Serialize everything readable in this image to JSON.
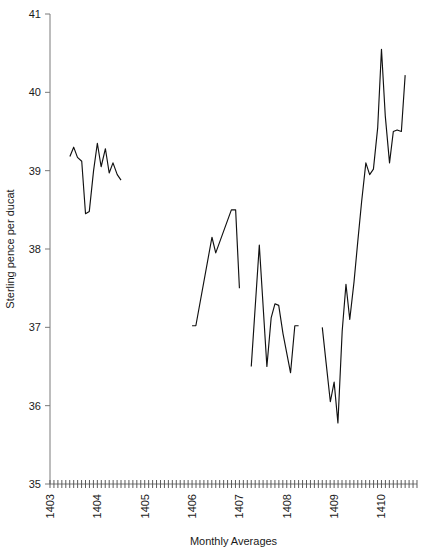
{
  "chart_data": {
    "type": "line",
    "title": "",
    "xlabel": "Monthly Averages",
    "ylabel": "Sterling pence per ducat",
    "ylim": [
      35,
      41
    ],
    "y_ticks": [
      35,
      36,
      37,
      38,
      39,
      40,
      41
    ],
    "y_tick_labels": [
      "35",
      "36",
      "37",
      "38",
      "39",
      "40",
      "41"
    ],
    "xlim": [
      1403.0,
      1410.75
    ],
    "x_year_ticks": [
      1403,
      1404,
      1405,
      1406,
      1407,
      1408,
      1409,
      1410
    ],
    "x_year_labels": [
      "1403",
      "1404",
      "1405",
      "1406",
      "1407",
      "1408",
      "1409",
      "1410"
    ],
    "x_minor_tick_interval_years": 0.08333,
    "grid": false,
    "legend": null,
    "series": [
      {
        "name": "Sterling pence per ducat",
        "note": "single series plotted in four separate runs separated by gaps of missing months",
        "segments": [
          {
            "name": "segment-1403-1404",
            "points": [
              {
                "x": 1403.42,
                "y": 39.18
              },
              {
                "x": 1403.5,
                "y": 39.3
              },
              {
                "x": 1403.58,
                "y": 39.17
              },
              {
                "x": 1403.67,
                "y": 39.12
              },
              {
                "x": 1403.75,
                "y": 38.45
              },
              {
                "x": 1403.83,
                "y": 38.48
              },
              {
                "x": 1403.92,
                "y": 39.0
              },
              {
                "x": 1404.0,
                "y": 39.35
              },
              {
                "x": 1404.08,
                "y": 39.05
              },
              {
                "x": 1404.17,
                "y": 39.28
              },
              {
                "x": 1404.25,
                "y": 38.97
              },
              {
                "x": 1404.33,
                "y": 39.1
              },
              {
                "x": 1404.42,
                "y": 38.95
              },
              {
                "x": 1404.5,
                "y": 38.88
              }
            ]
          },
          {
            "name": "segment-1406-1407",
            "points": [
              {
                "x": 1406.0,
                "y": 37.02
              },
              {
                "x": 1406.08,
                "y": 37.02
              },
              {
                "x": 1406.42,
                "y": 38.15
              },
              {
                "x": 1406.5,
                "y": 37.95
              },
              {
                "x": 1406.83,
                "y": 38.5
              },
              {
                "x": 1406.92,
                "y": 38.5
              },
              {
                "x": 1407.0,
                "y": 37.5
              }
            ]
          },
          {
            "name": "segment-1407-1408",
            "points": [
              {
                "x": 1407.25,
                "y": 36.5
              },
              {
                "x": 1407.42,
                "y": 38.05
              },
              {
                "x": 1407.58,
                "y": 36.5
              },
              {
                "x": 1407.67,
                "y": 37.12
              },
              {
                "x": 1407.75,
                "y": 37.3
              },
              {
                "x": 1407.83,
                "y": 37.28
              },
              {
                "x": 1407.92,
                "y": 36.92
              },
              {
                "x": 1408.08,
                "y": 36.42
              },
              {
                "x": 1408.17,
                "y": 37.02
              },
              {
                "x": 1408.25,
                "y": 37.02
              }
            ]
          },
          {
            "name": "segment-1409-1410",
            "points": [
              {
                "x": 1408.75,
                "y": 37.0
              },
              {
                "x": 1408.83,
                "y": 36.55
              },
              {
                "x": 1408.92,
                "y": 36.05
              },
              {
                "x": 1409.0,
                "y": 36.3
              },
              {
                "x": 1409.08,
                "y": 35.78
              },
              {
                "x": 1409.17,
                "y": 36.95
              },
              {
                "x": 1409.25,
                "y": 37.55
              },
              {
                "x": 1409.33,
                "y": 37.1
              },
              {
                "x": 1409.42,
                "y": 37.58
              },
              {
                "x": 1409.5,
                "y": 38.1
              },
              {
                "x": 1409.58,
                "y": 38.6
              },
              {
                "x": 1409.67,
                "y": 39.1
              },
              {
                "x": 1409.75,
                "y": 38.95
              },
              {
                "x": 1409.83,
                "y": 39.02
              },
              {
                "x": 1409.92,
                "y": 39.55
              },
              {
                "x": 1410.0,
                "y": 40.55
              },
              {
                "x": 1410.08,
                "y": 39.7
              },
              {
                "x": 1410.17,
                "y": 39.1
              },
              {
                "x": 1410.25,
                "y": 39.5
              },
              {
                "x": 1410.33,
                "y": 39.52
              },
              {
                "x": 1410.42,
                "y": 39.5
              },
              {
                "x": 1410.5,
                "y": 40.22
              }
            ]
          }
        ]
      }
    ]
  }
}
